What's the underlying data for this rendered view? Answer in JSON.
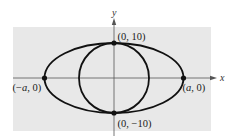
{
  "figure": {
    "type": "ellipse-and-circle-diagram",
    "background_panel_color": "#e8e8e8",
    "curve_color": "#111111",
    "axis_color": "#555555",
    "axes": {
      "x_label": "x",
      "y_label": "y"
    },
    "shapes": [
      {
        "kind": "ellipse",
        "center": [
          0,
          0
        ],
        "semi_major": "a",
        "semi_minor": 10
      },
      {
        "kind": "circle",
        "center": [
          0,
          0
        ],
        "radius": 10
      }
    ],
    "points": [
      {
        "id": "top",
        "label": "(0, 10)"
      },
      {
        "id": "bottom",
        "label": "(0, −10)"
      },
      {
        "id": "left",
        "label_prefix": "(−",
        "label_var": "a",
        "label_suffix": ", 0)"
      },
      {
        "id": "right",
        "label_prefix": "(",
        "label_var": "a",
        "label_suffix": ", 0)"
      }
    ]
  }
}
